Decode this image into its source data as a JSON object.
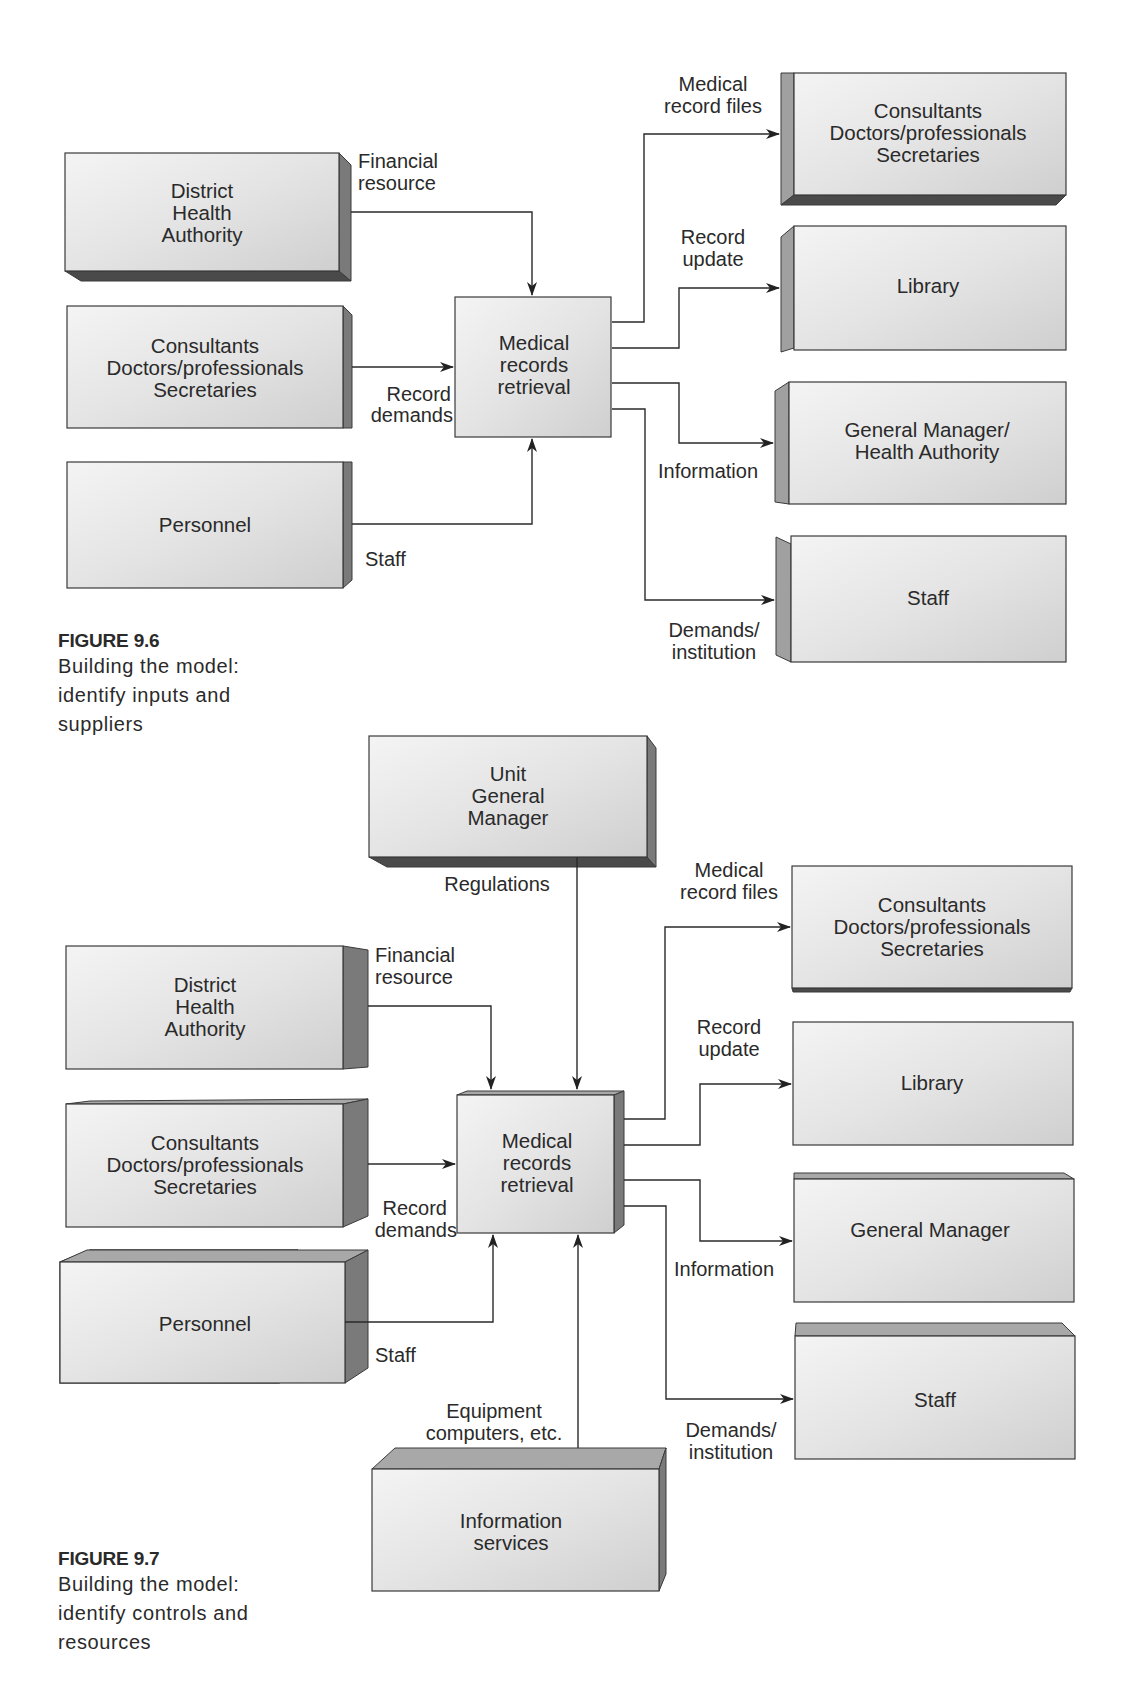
{
  "figure_9_6": {
    "caption": {
      "title": "FIGURE 9.6",
      "lines": [
        "Building the model:",
        "identify inputs and",
        "suppliers"
      ]
    },
    "center": [
      "Medical",
      "records",
      "retrieval"
    ],
    "suppliers": [
      {
        "lines": [
          "District",
          "Health",
          "Authority"
        ]
      },
      {
        "lines": [
          "Consultants",
          "Doctors/professionals",
          "Secretaries"
        ]
      },
      {
        "lines": [
          "Personnel"
        ]
      }
    ],
    "inputs": {
      "financial": [
        "Financial",
        "resource"
      ],
      "record_demands": [
        "Record",
        "demands"
      ],
      "staff": [
        "Staff"
      ]
    },
    "customers": [
      {
        "lines": [
          "Consultants",
          "Doctors/professionals",
          "Secretaries"
        ]
      },
      {
        "lines": [
          "Library"
        ]
      },
      {
        "lines": [
          "General Manager/",
          "Health Authority"
        ]
      },
      {
        "lines": [
          "Staff"
        ]
      }
    ],
    "outputs": {
      "medical_record_files": [
        "Medical",
        "record files"
      ],
      "record_update": [
        "Record",
        "update"
      ],
      "information": [
        "Information"
      ],
      "demands_institution": [
        "Demands/",
        "institution"
      ]
    }
  },
  "figure_9_7": {
    "caption": {
      "title": "FIGURE 9.7",
      "lines": [
        "Building the model:",
        "identify controls and",
        "resources"
      ]
    },
    "control_box": [
      "Unit",
      "General",
      "Manager"
    ],
    "control_label": [
      "Regulations"
    ],
    "center": [
      "Medical",
      "records",
      "retrieval"
    ],
    "suppliers": [
      {
        "lines": [
          "District",
          "Health",
          "Authority"
        ]
      },
      {
        "lines": [
          "Consultants",
          "Doctors/professionals",
          "Secretaries"
        ]
      },
      {
        "lines": [
          "Personnel"
        ]
      }
    ],
    "inputs": {
      "financial": [
        "Financial",
        "resource"
      ],
      "record_demands": [
        "Record",
        "demands"
      ],
      "staff": [
        "Staff"
      ]
    },
    "resource_box": [
      "Information",
      "services"
    ],
    "resource_label": [
      "Equipment",
      "computers, etc."
    ],
    "customers": [
      {
        "lines": [
          "Consultants",
          "Doctors/professionals",
          "Secretaries"
        ]
      },
      {
        "lines": [
          "Library"
        ]
      },
      {
        "lines": [
          "General Manager"
        ]
      },
      {
        "lines": [
          "Staff"
        ]
      }
    ],
    "outputs": {
      "medical_record_files": [
        "Medical",
        "record files"
      ],
      "record_update": [
        "Record",
        "update"
      ],
      "information": [
        "Information"
      ],
      "demands_institution": [
        "Demands/",
        "institution"
      ]
    }
  }
}
